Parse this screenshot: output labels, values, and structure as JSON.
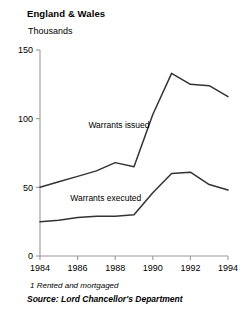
{
  "chart_data": {
    "type": "line",
    "title": "England & Wales",
    "subtitle": "Thousands",
    "xlabel": "",
    "ylabel": "Thousands",
    "x": [
      1984,
      1985,
      1986,
      1987,
      1988,
      1989,
      1990,
      1991,
      1992,
      1993,
      1994
    ],
    "xlim": [
      1984,
      1994
    ],
    "ylim": [
      0,
      150
    ],
    "yticks": [
      0,
      50,
      100,
      150
    ],
    "ytick_labels": [
      "0",
      "50",
      "100",
      "150"
    ],
    "xticks": [
      1984,
      1986,
      1988,
      1990,
      1992,
      1994
    ],
    "xtick_labels": [
      "1984",
      "1986",
      "1988",
      "1990",
      "1992",
      "1994"
    ],
    "grid": false,
    "legend_position": "inline-annotation",
    "series": [
      {
        "name": "Warrants issued",
        "values": [
          50,
          54,
          58,
          62,
          68,
          65,
          103,
          133,
          125,
          124,
          116
        ],
        "color": "#333333"
      },
      {
        "name": "Warrants executed",
        "values": [
          25,
          26,
          28,
          29,
          29,
          30,
          46,
          60,
          61,
          52,
          48
        ],
        "color": "#333333"
      }
    ],
    "annotations": [
      {
        "text": "Warrants issued",
        "x": 1988.2,
        "y": 93
      },
      {
        "text": "Warrants executed",
        "x": 1987.5,
        "y": 40
      }
    ],
    "footnote": "1  Rented and mortgaged",
    "source": "Source: Lord Chancellor's Department"
  },
  "geometry": {
    "plot_left": 40,
    "plot_right": 228,
    "plot_top": 50,
    "plot_bottom": 256
  }
}
